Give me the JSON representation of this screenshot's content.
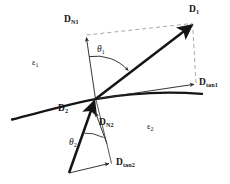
{
  "figure": {
    "type": "physics-diagram",
    "canvas": {
      "width": 230,
      "height": 184,
      "background": "#ffffff"
    },
    "colors": {
      "stroke": "#151515",
      "thin_stroke": "#2b2b2b",
      "dashed": "#9a9a9a",
      "text": "#151515"
    },
    "labels": {
      "d_n1": {
        "symbol": "D",
        "subscript": "N1",
        "x": 64,
        "y": 16
      },
      "d_1": {
        "symbol": "D",
        "subscript": "1",
        "x": 189,
        "y": 6
      },
      "d_tan1": {
        "symbol": "D",
        "subscript": "tan1",
        "x": 199,
        "y": 79
      },
      "d_2": {
        "symbol": "D",
        "subscript": "2",
        "x": 58,
        "y": 105
      },
      "d_n2": {
        "symbol": "D",
        "subscript": "N2",
        "x": 99,
        "y": 119
      },
      "d_tan2": {
        "symbol": "D",
        "subscript": "tan2",
        "x": 116,
        "y": 159
      },
      "theta_1": {
        "symbol": "θ",
        "subscript": "1",
        "x": 97,
        "y": 46
      },
      "theta_2": {
        "symbol": "θ",
        "subscript": "2",
        "x": 69,
        "y": 139
      },
      "epsilon_1": {
        "symbol": "ε",
        "subscript": "1",
        "x": 32,
        "y": 59
      },
      "epsilon_2": {
        "symbol": "ε",
        "subscript": "2",
        "x": 147,
        "y": 123
      }
    },
    "geometry": {
      "origin": {
        "x": 95.5,
        "y": 99
      },
      "interface_curve": "M 12,119 C 40,112 70,104 95.5,99 C 130,93 170,92 202,94",
      "vector_d_n1": {
        "from": [
          95.5,
          99
        ],
        "to": [
          86,
          36
        ],
        "style": "thin-arrow"
      },
      "vector_d1": {
        "from": [
          95.5,
          99
        ],
        "to": [
          193,
          24
        ],
        "style": "bold-arrow"
      },
      "vector_d_tan1": {
        "from": [
          95.5,
          99
        ],
        "to": [
          196,
          84
        ],
        "style": "thin-arrow"
      },
      "vector_d2": {
        "from": [
          69,
          173
        ],
        "to": [
          95.5,
          99
        ],
        "style": "bold-arrow"
      },
      "vector_d_n2": {
        "from": [
          106,
          143
        ],
        "to": [
          97,
          112
        ],
        "style": "thin-arrow"
      },
      "vector_d_tan2": {
        "from": [
          69,
          173
        ],
        "to": [
          111,
          163
        ],
        "style": "thin-arrow"
      },
      "dashed_n1_to_d1": {
        "from": [
          86,
          36
        ],
        "to": [
          193,
          24
        ]
      },
      "dashed_tan1_to_d1": {
        "from": [
          196,
          84
        ],
        "to": [
          193,
          24
        ]
      },
      "construct_line_d2_side": {
        "from": [
          95.5,
          99
        ],
        "to": [
          107,
          145
        ]
      },
      "construct_line_tan2": {
        "from": [
          107,
          145
        ],
        "to": [
          111,
          163
        ]
      },
      "arc_theta1": {
        "center": [
          95.5,
          99
        ],
        "radius": 43,
        "start_deg": 261,
        "end_deg": 322
      },
      "arc_theta2": {
        "center": [
          69,
          173
        ],
        "radius": 42,
        "start_deg": 289,
        "end_deg": 346
      }
    }
  }
}
